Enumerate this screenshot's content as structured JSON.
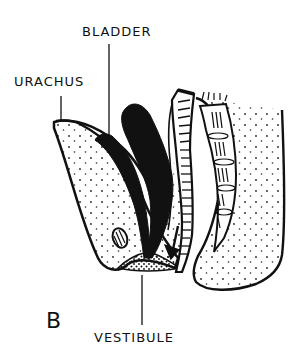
{
  "figure": {
    "panel_letter": "B",
    "labels": {
      "bladder": "BLADDER",
      "urachus": "URACHUS",
      "vestibule": "VESTIBULE"
    }
  }
}
